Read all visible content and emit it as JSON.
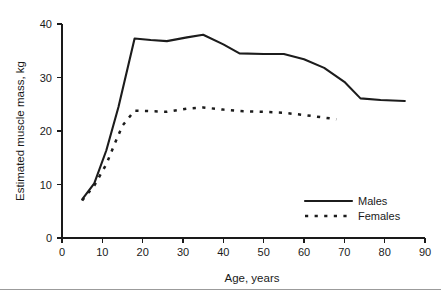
{
  "chart_data": {
    "type": "line",
    "title": "",
    "xlabel": "Age, years",
    "ylabel": "Estimated muscle mass, kg",
    "xlim": [
      0,
      90
    ],
    "ylim": [
      0,
      40
    ],
    "xticks": [
      0,
      10,
      20,
      30,
      40,
      50,
      60,
      70,
      80,
      90
    ],
    "yticks": [
      0,
      10,
      20,
      30,
      40
    ],
    "grid": false,
    "legend_position": "lower right",
    "series": [
      {
        "name": "Males",
        "style": "solid",
        "color": "#1c1c1c",
        "x": [
          5,
          8,
          11,
          14,
          18,
          22,
          26,
          31,
          35,
          40,
          44,
          50,
          55,
          60,
          65,
          70,
          74,
          79,
          85
        ],
        "y": [
          7.2,
          10.2,
          16.4,
          24.5,
          37.3,
          37.0,
          36.8,
          37.5,
          38.0,
          36.2,
          34.5,
          34.4,
          34.4,
          33.4,
          31.8,
          29.2,
          26.1,
          25.8,
          25.6
        ]
      },
      {
        "name": "Females",
        "style": "dashed",
        "color": "#1c1c1c",
        "x": [
          5,
          8,
          11,
          13,
          15,
          18,
          22,
          26,
          31,
          35,
          40,
          45,
          50,
          55,
          60,
          64,
          68
        ],
        "y": [
          7.0,
          9.8,
          13.8,
          17.5,
          21.0,
          23.8,
          23.7,
          23.6,
          24.2,
          24.4,
          24.0,
          23.7,
          23.6,
          23.4,
          23.0,
          22.6,
          22.2
        ]
      }
    ]
  },
  "axes": {
    "y_title": "Estimated muscle mass, kg",
    "x_title": "Age, years",
    "y_tick_labels": [
      "0",
      "10",
      "20",
      "30",
      "40"
    ],
    "x_tick_labels": [
      "0",
      "10",
      "20",
      "30",
      "40",
      "50",
      "60",
      "70",
      "80",
      "90"
    ]
  },
  "legend": {
    "entries": [
      {
        "label": "Males",
        "style": "solid"
      },
      {
        "label": "Females",
        "style": "dashed"
      }
    ]
  }
}
